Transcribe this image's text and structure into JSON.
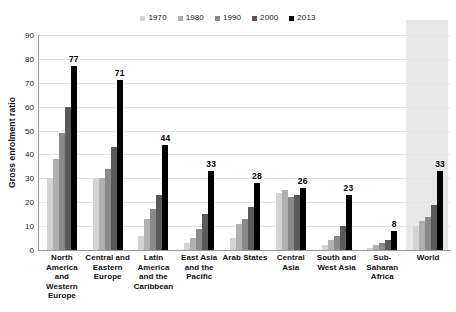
{
  "chart_data": {
    "type": "bar",
    "title": "",
    "subtitle": "",
    "xlabel": "",
    "ylabel": "Gross enrolment ratio",
    "ylim": [
      0,
      90
    ],
    "ytick_step": 10,
    "yticks": [
      "0",
      "10",
      "20",
      "30",
      "40",
      "50",
      "60",
      "70",
      "80",
      "90"
    ],
    "grid": true,
    "legend_position": "top-center",
    "categories": [
      "North America and Western Europe",
      "Central and Eastern Europe",
      "Latin America and the Caribbean",
      "East Asia and the Pacific",
      "Arab States",
      "Central Asia",
      "South and West Asia",
      "Sub-Saharan Africa",
      "World"
    ],
    "category_lines": [
      [
        "North",
        "America and",
        "Western",
        "Europe"
      ],
      [
        "Central and",
        "Eastern",
        "Europe"
      ],
      [
        "Latin",
        "America",
        "and the",
        "Caribbean"
      ],
      [
        "East Asia",
        "and the",
        "Pacific"
      ],
      [
        "Arab States"
      ],
      [
        "Central",
        "Asia"
      ],
      [
        "South and",
        "West Asia"
      ],
      [
        "Sub-Saharan",
        "Africa"
      ],
      [
        "World"
      ]
    ],
    "series": [
      {
        "name": "1970",
        "color": "#d4d4d4",
        "values": [
          30,
          30,
          6,
          3,
          5,
          24,
          2,
          1,
          10
        ]
      },
      {
        "name": "1980",
        "color": "#b0b0b0",
        "values": [
          38,
          30,
          13,
          5,
          11,
          25,
          4,
          2,
          12
        ]
      },
      {
        "name": "1990",
        "color": "#8a8a8a",
        "values": [
          49,
          34,
          17,
          9,
          13,
          22,
          6,
          3,
          14
        ]
      },
      {
        "name": "2000",
        "color": "#5a5a5a",
        "values": [
          60,
          43,
          23,
          15,
          18,
          23,
          10,
          4,
          19
        ]
      },
      {
        "name": "2013",
        "color": "#000000",
        "values": [
          77,
          71,
          44,
          33,
          28,
          26,
          23,
          8,
          33
        ]
      }
    ],
    "data_labels": {
      "series": "2013",
      "values": [
        "77",
        "71",
        "44",
        "33",
        "28",
        "26",
        "23",
        "8",
        "33"
      ]
    },
    "highlight_band": {
      "category": "World",
      "color": "#e8e8e8"
    }
  }
}
